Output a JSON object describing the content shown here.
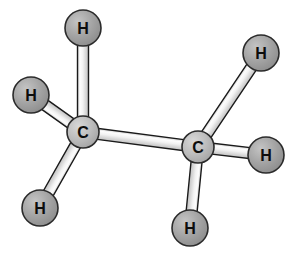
{
  "figure": {
    "molecule_name": "ethane",
    "formula": "C2H6",
    "background_color": "#ffffff",
    "width": 295,
    "height": 254
  },
  "palette": {
    "background": "#ffffff",
    "carbon_fill": "#b3b3b3",
    "carbon_fill_light": "#cfcfcf",
    "hydrogen_fill": "#9a9a9a",
    "hydrogen_fill_light": "#bdbdbd",
    "atom_outline": "#2b2b2b",
    "bond_light": "#fbfbfb",
    "bond_mid": "#e6e6e6",
    "bond_shadow": "#b9b9b9",
    "bond_outline": "#1a1a1a",
    "label_color": "#0d0d0d"
  },
  "atoms": [
    {
      "id": "C1",
      "element": "C",
      "label": "C",
      "cx": 83,
      "cy": 132,
      "r": 16,
      "kind": "carbon",
      "font_size": 16
    },
    {
      "id": "C2",
      "element": "C",
      "label": "C",
      "cx": 198,
      "cy": 147,
      "r": 16,
      "kind": "carbon",
      "font_size": 16
    },
    {
      "id": "H1",
      "element": "H",
      "label": "H",
      "cx": 83,
      "cy": 28,
      "r": 18,
      "kind": "hydrogen",
      "font_size": 16
    },
    {
      "id": "H2",
      "element": "H",
      "label": "H",
      "cx": 31,
      "cy": 95,
      "r": 18,
      "kind": "hydrogen",
      "font_size": 16
    },
    {
      "id": "H3",
      "element": "H",
      "label": "H",
      "cx": 40,
      "cy": 208,
      "r": 18,
      "kind": "hydrogen",
      "font_size": 16
    },
    {
      "id": "H4",
      "element": "H",
      "label": "H",
      "cx": 261,
      "cy": 53,
      "r": 18,
      "kind": "hydrogen",
      "font_size": 16
    },
    {
      "id": "H5",
      "element": "H",
      "label": "H",
      "cx": 266,
      "cy": 155,
      "r": 18,
      "kind": "hydrogen",
      "font_size": 16
    },
    {
      "id": "H6",
      "element": "H",
      "label": "H",
      "cx": 190,
      "cy": 228,
      "r": 18,
      "kind": "hydrogen",
      "font_size": 16
    }
  ],
  "bonds": [
    {
      "id": "C1-C2",
      "from": "C1",
      "to": "C2",
      "x1": 83,
      "y1": 132,
      "x2": 198,
      "y2": 147,
      "width": 11,
      "order": 1
    },
    {
      "id": "C1-H1",
      "from": "C1",
      "to": "H1",
      "x1": 83,
      "y1": 132,
      "x2": 83,
      "y2": 28,
      "width": 11,
      "order": 1
    },
    {
      "id": "C1-H2",
      "from": "C1",
      "to": "H2",
      "x1": 83,
      "y1": 132,
      "x2": 31,
      "y2": 95,
      "width": 11,
      "order": 1
    },
    {
      "id": "C1-H3",
      "from": "C1",
      "to": "H3",
      "x1": 83,
      "y1": 132,
      "x2": 40,
      "y2": 208,
      "width": 11,
      "order": 1
    },
    {
      "id": "C2-H4",
      "from": "C2",
      "to": "H4",
      "x1": 198,
      "y1": 147,
      "x2": 261,
      "y2": 53,
      "width": 11,
      "order": 1
    },
    {
      "id": "C2-H5",
      "from": "C2",
      "to": "H5",
      "x1": 198,
      "y1": 147,
      "x2": 266,
      "y2": 155,
      "width": 11,
      "order": 1
    },
    {
      "id": "C2-H6",
      "from": "C2",
      "to": "H6",
      "x1": 198,
      "y1": 147,
      "x2": 190,
      "y2": 228,
      "width": 11,
      "order": 1
    }
  ]
}
